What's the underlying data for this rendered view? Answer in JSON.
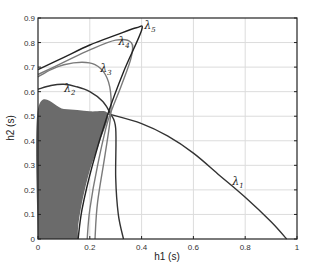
{
  "chart_data": {
    "type": "line",
    "title": "",
    "xlabel": "h1 (s)",
    "ylabel": "h2 (s)",
    "xlim": [
      0,
      1
    ],
    "ylim": [
      0,
      0.9
    ],
    "xticks": [
      "0",
      "0.2",
      "0.4",
      "0.6",
      "0.8",
      "1"
    ],
    "yticks": [
      "0",
      "0.1",
      "0.2",
      "0.3",
      "0.4",
      "0.5",
      "0.6",
      "0.7",
      "0.8",
      "0.9"
    ],
    "grid": true,
    "legend": "none (inline curve labels)",
    "shaded_region": {
      "name": "stable region",
      "color": "#6b6b6b",
      "boundary": [
        [
          0,
          0
        ],
        [
          0,
          0.53
        ],
        [
          0.1,
          0.53
        ],
        [
          0.2,
          0.52
        ],
        [
          0.27,
          0.51
        ],
        [
          0.24,
          0.4
        ],
        [
          0.2,
          0.28
        ],
        [
          0.17,
          0.15
        ],
        [
          0.155,
          0.05
        ],
        [
          0.155,
          0
        ]
      ]
    },
    "series": [
      {
        "name": "λ1",
        "label": "λ1",
        "color": "#333333",
        "x": [
          0.27,
          0.4,
          0.5,
          0.6,
          0.7,
          0.8,
          0.9,
          0.96
        ],
        "y": [
          0.51,
          0.47,
          0.42,
          0.35,
          0.26,
          0.17,
          0.07,
          0.0
        ]
      },
      {
        "name": "λ2",
        "label": "λ2",
        "color": "#333333",
        "x": [
          0,
          0.05,
          0.1,
          0.15,
          0.2,
          0.25,
          0.28,
          0.3,
          0.3,
          0.31,
          0.33
        ],
        "y": [
          0.61,
          0.625,
          0.63,
          0.62,
          0.6,
          0.56,
          0.51,
          0.45,
          0.25,
          0.1,
          0.0
        ]
      },
      {
        "name": "λ3",
        "label": "λ3",
        "color": "#7a7a7a",
        "x": [
          0,
          0.05,
          0.1,
          0.17,
          0.22,
          0.26,
          0.28,
          0.28,
          0.26,
          0.23,
          0.22
        ],
        "y": [
          0.66,
          0.69,
          0.71,
          0.72,
          0.71,
          0.67,
          0.6,
          0.5,
          0.35,
          0.15,
          0.0
        ]
      },
      {
        "name": "λ4",
        "label": "λ4",
        "color": "#7a7a7a",
        "x": [
          0,
          0.1,
          0.2,
          0.3,
          0.36,
          0.36,
          0.32,
          0.27,
          0.23,
          0.2,
          0.19
        ],
        "y": [
          0.67,
          0.72,
          0.77,
          0.81,
          0.8,
          0.74,
          0.62,
          0.48,
          0.3,
          0.12,
          0.0
        ]
      },
      {
        "name": "λ5",
        "label": "λ5",
        "color": "#222222",
        "x": [
          0,
          0.1,
          0.2,
          0.3,
          0.38,
          0.4,
          0.33,
          0.27,
          0.21,
          0.17,
          0.155
        ],
        "y": [
          0.69,
          0.74,
          0.79,
          0.83,
          0.86,
          0.85,
          0.68,
          0.51,
          0.3,
          0.12,
          0.0
        ]
      }
    ],
    "annotations": [
      {
        "text": "λ1",
        "x": 0.75,
        "y": 0.22
      },
      {
        "text": "λ2",
        "x": 0.1,
        "y": 0.6
      },
      {
        "text": "λ3",
        "x": 0.24,
        "y": 0.68
      },
      {
        "text": "λ4",
        "x": 0.31,
        "y": 0.79
      },
      {
        "text": "λ5",
        "x": 0.41,
        "y": 0.855
      }
    ]
  }
}
